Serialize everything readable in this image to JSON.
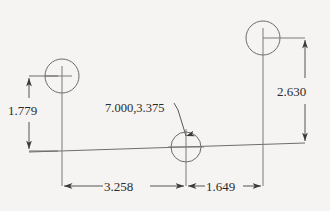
{
  "drawing": {
    "title": "Engineering dimension sketch",
    "background_color": "#f5f4f2",
    "line_color": "#6b6b6b",
    "text_color": "#2b2b2b",
    "dimensions": [
      {
        "id": "left-vertical",
        "label": "1.779",
        "orientation": "vertical",
        "position": "left",
        "measures": "height from baseline to left circle center"
      },
      {
        "id": "right-vertical",
        "label": "2.630",
        "orientation": "vertical",
        "position": "right",
        "measures": "height from baseline to right circle center"
      },
      {
        "id": "bottom-left-horizontal",
        "label": "3.258",
        "orientation": "horizontal",
        "position": "bottom-left",
        "measures": "distance from left circle center to middle circle center"
      },
      {
        "id": "bottom-right-horizontal",
        "label": "1.649",
        "orientation": "horizontal",
        "position": "bottom-right",
        "measures": "distance from middle circle center to right circle center"
      }
    ],
    "annotations": [
      {
        "id": "center-coordinate-note",
        "label": "7.000,3.375",
        "points_to": "middle-circle-center",
        "leader": true
      }
    ],
    "features": [
      {
        "id": "left-circle",
        "type": "circle"
      },
      {
        "id": "middle-circle",
        "type": "circle"
      },
      {
        "id": "right-circle",
        "type": "circle"
      },
      {
        "id": "baseline",
        "type": "line"
      }
    ]
  }
}
